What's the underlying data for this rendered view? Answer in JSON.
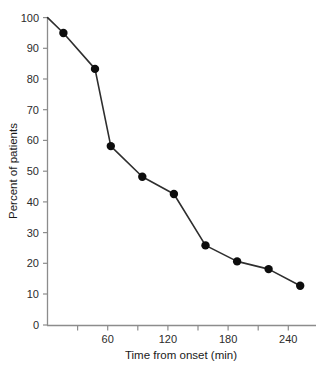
{
  "chart_data": {
    "type": "line",
    "title": "",
    "xlabel": "Time from onset (min)",
    "ylabel": "Percent of patients",
    "xlim": [
      0,
      255
    ],
    "ylim": [
      0,
      100
    ],
    "grid": false,
    "legend": null,
    "x": [
      0,
      15,
      45,
      60,
      90,
      120,
      150,
      180,
      210,
      240
    ],
    "values": [
      100,
      95,
      83.3,
      58.2,
      48.2,
      42.6,
      25.9,
      20.7,
      18.2,
      12.8
    ],
    "series": [
      {
        "name": "Percent of patients",
        "x": [
          0,
          15,
          45,
          60,
          90,
          120,
          150,
          180,
          210,
          240
        ],
        "values": [
          100,
          95,
          83.3,
          58.2,
          48.2,
          42.6,
          25.9,
          20.7,
          18.2,
          12.8
        ],
        "marker": "filled-circle",
        "color": "#0d0d0d"
      }
    ],
    "y_ticks": [
      0,
      10,
      20,
      30,
      40,
      50,
      60,
      70,
      80,
      90,
      100
    ],
    "y_tick_labels": [
      "0",
      "10",
      "20",
      "30",
      "40",
      "50",
      "60",
      "70",
      "80",
      "90",
      "100"
    ],
    "x_ticks": [
      30,
      60,
      90,
      120,
      150,
      180,
      210,
      240
    ],
    "x_tick_labels": [
      "",
      "60",
      "",
      "120",
      "",
      "180",
      "",
      "240"
    ],
    "x_major_ticks": [
      60,
      120,
      180,
      240
    ],
    "x_major_tick_labels": [
      "60",
      "120",
      "180",
      "240"
    ],
    "colors": {
      "line": "#2e2e2e",
      "marker": "#0d0d0d",
      "axis": "#8c8c8c",
      "text": "#1a1a1a",
      "background": "#ffffff"
    }
  }
}
